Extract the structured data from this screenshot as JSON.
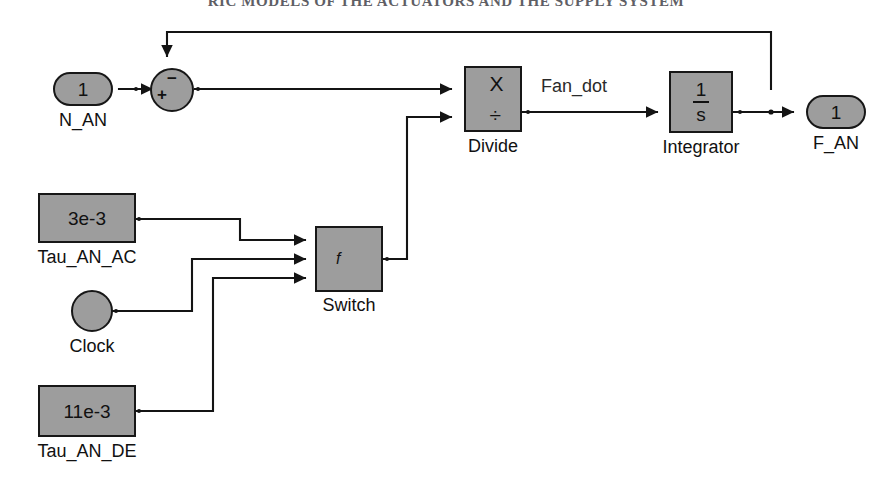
{
  "page": {
    "header_text": "RIC MODELS OF THE ACTUATORS AND THE SUPPLY SYSTEM",
    "background": "#ffffff",
    "block_fill": "#9d9d9d",
    "line_color": "#141414"
  },
  "diagram": {
    "type": "simulink-block-diagram",
    "ports": {
      "input": {
        "number": "1",
        "label": "N_AN"
      },
      "output": {
        "number": "1",
        "label": "F_AN"
      }
    },
    "blocks": [
      {
        "id": "sum",
        "kind": "sum-junction",
        "label": "",
        "plus_sign": "+",
        "minus_sign": "−"
      },
      {
        "id": "divide",
        "kind": "product-divide",
        "label": "Divide",
        "op_top": "X",
        "op_bottom": "÷"
      },
      {
        "id": "integrator",
        "kind": "integrator",
        "label": "Integrator",
        "numerator": "1",
        "denominator": "s"
      },
      {
        "id": "switch",
        "kind": "switch",
        "label": "Switch",
        "criteria_symbol": "f"
      },
      {
        "id": "tau_an_ac",
        "kind": "constant",
        "label": "Tau_AN_AC",
        "value": "3e-3"
      },
      {
        "id": "clock",
        "kind": "clock",
        "label": "Clock",
        "value": ""
      },
      {
        "id": "tau_an_de",
        "kind": "constant",
        "label": "Tau_AN_DE",
        "value": "11e-3"
      }
    ],
    "signal_labels": [
      {
        "id": "fan_dot",
        "text": "Fan_dot"
      }
    ],
    "connections": [
      {
        "from": "N_AN",
        "to": "sum",
        "port": "+"
      },
      {
        "from": "F_AN",
        "to": "sum",
        "port": "−",
        "style": "feedback"
      },
      {
        "from": "sum",
        "to": "divide",
        "port": "X"
      },
      {
        "from": "switch",
        "to": "divide",
        "port": "÷"
      },
      {
        "from": "divide",
        "to": "integrator",
        "label": "Fan_dot"
      },
      {
        "from": "integrator",
        "to": "F_AN"
      },
      {
        "from": "tau_an_ac",
        "to": "switch",
        "port": "1"
      },
      {
        "from": "clock",
        "to": "switch",
        "port": "2"
      },
      {
        "from": "tau_an_de",
        "to": "switch",
        "port": "3"
      }
    ]
  }
}
